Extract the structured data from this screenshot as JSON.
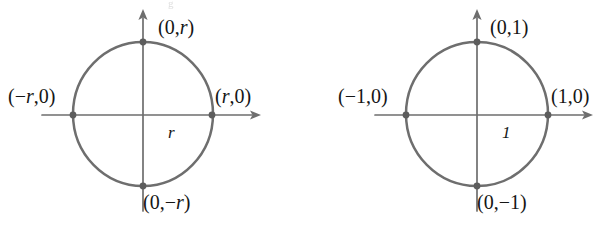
{
  "figure": {
    "background_color": "#ffffff",
    "stroke_color": "#6e6e6e",
    "text_color": "#151515",
    "dot_color": "#5d5d5d",
    "artifact_text": "g",
    "panels": [
      {
        "id": "circle-radius-r",
        "name": "circle-of-radius-r",
        "center": {
          "x": 143,
          "y": 114
        },
        "radius_x": 70,
        "radius_y": 72,
        "axes": {
          "x_axis": {
            "x1": 42,
            "x2": 261,
            "y": 115,
            "arrow": "right"
          },
          "y_axis": {
            "y1": 9,
            "y2": 211,
            "x": 143,
            "arrow": "up"
          }
        },
        "radius_label": "r",
        "points": [
          {
            "name": "top",
            "label": "(0,r)",
            "lead": "(0,",
            "var": "r",
            "trail": ")",
            "cx": 143,
            "cy": 42,
            "label_x": 158,
            "label_y": 17
          },
          {
            "name": "right",
            "label": "(r,0)",
            "lead": "(",
            "var": "r",
            "trail": ",0)",
            "cx": 212,
            "cy": 115,
            "label_x": 215,
            "label_y": 86
          },
          {
            "name": "bottom",
            "label": "(0,-r)",
            "lead": "(0,−",
            "var": "r",
            "trail": ")",
            "cx": 143,
            "cy": 186,
            "label_x": 143,
            "label_y": 192
          },
          {
            "name": "left",
            "label": "(-r,0)",
            "lead": "(−",
            "var": "r",
            "trail": ",0)",
            "cx": 73,
            "cy": 115,
            "label_x": 8,
            "label_y": 86
          }
        ]
      },
      {
        "id": "unit-circle",
        "name": "unit-circle",
        "center": {
          "x": 477,
          "y": 114
        },
        "radius_x": 71,
        "radius_y": 72,
        "axes": {
          "x_axis": {
            "x1": 375,
            "x2": 593,
            "y": 115,
            "arrow": "right"
          },
          "y_axis": {
            "y1": 9,
            "y2": 211,
            "x": 477,
            "arrow": "up"
          }
        },
        "radius_label": "1",
        "points": [
          {
            "name": "top",
            "label": "(0,1)",
            "lead": "(0,1)",
            "var": "",
            "trail": "",
            "cx": 477,
            "cy": 42,
            "label_x": 490,
            "label_y": 17
          },
          {
            "name": "right",
            "label": "(1,0)",
            "lead": "(1,0)",
            "var": "",
            "trail": "",
            "cx": 548,
            "cy": 115,
            "label_x": 551,
            "label_y": 86
          },
          {
            "name": "bottom",
            "label": "(0,-1)",
            "lead": "(0,−1)",
            "var": "",
            "trail": "",
            "cx": 477,
            "cy": 186,
            "label_x": 477,
            "label_y": 192
          },
          {
            "name": "left",
            "label": "(-1,0)",
            "lead": "(−1,0)",
            "var": "",
            "trail": "",
            "cx": 406,
            "cy": 115,
            "label_x": 338,
            "label_y": 86
          }
        ]
      }
    ]
  }
}
